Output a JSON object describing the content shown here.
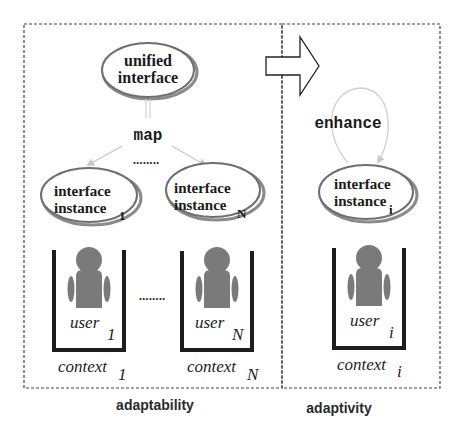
{
  "diagram": {
    "colors": {
      "ellipse_stroke": "#6e6e6e",
      "ellipse_shadow": "#8a8a8a",
      "arrow_light": "#c8c8c8",
      "user_fill": "#7a7a7a",
      "container_stroke": "#1e1e1e",
      "dashed_border": "#444444"
    },
    "unified_interface": {
      "line1": "unified",
      "line2": "interface"
    },
    "map_label": "map",
    "ellipsis": "........",
    "instances": [
      {
        "line1": "interface",
        "line2": "instance",
        "subscript": "1"
      },
      {
        "line1": "interface",
        "line2": "instance",
        "subscript": "N"
      },
      {
        "line1": "interface",
        "line2": "instance",
        "subscript": "i"
      }
    ],
    "users": [
      {
        "label": "user",
        "subscript": "1",
        "context": "context",
        "context_subscript": "1"
      },
      {
        "label": "user",
        "subscript": "N",
        "context": "context",
        "context_subscript": "N"
      },
      {
        "label": "user",
        "subscript": "i",
        "context": "context",
        "context_subscript": "i"
      }
    ],
    "enhance_label": "enhance",
    "sections": {
      "left": "adaptability",
      "right": "adaptivity"
    }
  }
}
